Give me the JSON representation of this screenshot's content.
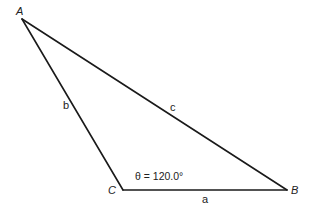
{
  "diagram": {
    "type": "triangle",
    "vertices": {
      "A": "A",
      "B": "B",
      "C": "C"
    },
    "sides": {
      "a": "a",
      "b": "b",
      "c": "c"
    },
    "angle": {
      "vertex": "C",
      "symbol": "θ",
      "value_deg": 120.0,
      "label": "θ = 120.0°"
    },
    "colors": {
      "line": "#1a1a1a",
      "text": "#222222",
      "background": "#ffffff"
    }
  }
}
